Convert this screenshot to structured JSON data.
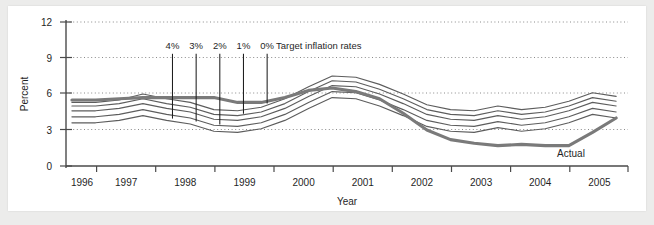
{
  "chart_data": {
    "type": "line",
    "title": "",
    "xlabel": "Year",
    "ylabel": "Percent",
    "ylim": [
      0,
      12
    ],
    "yticks": [
      0,
      3,
      6,
      9,
      12
    ],
    "ytick_labels": [
      "0",
      "3",
      "6",
      "9",
      "12"
    ],
    "xlim": [
      1995.5,
      2005.0
    ],
    "xtick_labels": [
      "1996",
      "1997",
      "1998",
      "1999",
      "2000",
      "2001",
      "2002",
      "2003",
      "2004",
      "2005"
    ],
    "grid": "horizontal dotted gridlines at 3, 6, 9, 12",
    "legend_position": "inline annotations",
    "annotations": {
      "target_group_label": "Target inflation rates",
      "actual_label": "Actual"
    },
    "target_markers": [
      {
        "label": "4%",
        "x": 1997.3,
        "y_top": 9.35,
        "y_bottom": 3.95
      },
      {
        "label": "3%",
        "x": 1997.7,
        "y_top": 9.35,
        "y_bottom": 3.7
      },
      {
        "label": "2%",
        "x": 1998.1,
        "y_top": 9.35,
        "y_bottom": 3.45
      },
      {
        "label": "1%",
        "x": 1998.5,
        "y_top": 9.35,
        "y_bottom": 4.35
      },
      {
        "label": "0%",
        "x": 1998.9,
        "y_top": 9.35,
        "y_bottom": 5.2
      }
    ],
    "x": [
      1995.6,
      1996.0,
      1996.4,
      1996.8,
      1997.2,
      1997.6,
      1998.0,
      1998.4,
      1998.8,
      1999.2,
      1999.6,
      2000.0,
      2000.4,
      2000.8,
      2001.2,
      2001.6,
      2002.0,
      2002.4,
      2002.8,
      2003.2,
      2003.6,
      2004.0,
      2004.4,
      2004.8
    ],
    "series": [
      {
        "name": "Target inflation 4%",
        "style": "thin",
        "values": [
          5.3,
          5.3,
          5.5,
          6.0,
          5.6,
          5.3,
          4.7,
          4.6,
          4.9,
          5.6,
          6.6,
          7.5,
          7.4,
          6.8,
          6.0,
          5.1,
          4.7,
          4.6,
          5.0,
          4.7,
          4.9,
          5.4,
          6.1,
          5.8
        ]
      },
      {
        "name": "Target inflation 3%",
        "style": "thin",
        "values": [
          5.0,
          5.0,
          5.2,
          5.6,
          5.2,
          4.9,
          4.3,
          4.2,
          4.5,
          5.2,
          6.2,
          7.1,
          7.0,
          6.4,
          5.6,
          4.7,
          4.3,
          4.2,
          4.6,
          4.3,
          4.5,
          5.0,
          5.7,
          5.4
        ]
      },
      {
        "name": "Target inflation 2%",
        "style": "thin",
        "values": [
          4.6,
          4.6,
          4.8,
          5.2,
          4.8,
          4.5,
          3.9,
          3.8,
          4.1,
          4.8,
          5.8,
          6.7,
          6.6,
          6.0,
          5.2,
          4.3,
          3.9,
          3.8,
          4.2,
          3.9,
          4.1,
          4.6,
          5.3,
          5.0
        ]
      },
      {
        "name": "Target inflation 1%",
        "style": "thin",
        "values": [
          4.1,
          4.1,
          4.3,
          4.7,
          4.3,
          4.0,
          3.4,
          3.3,
          3.6,
          4.3,
          5.3,
          6.2,
          6.1,
          5.5,
          4.7,
          3.8,
          3.4,
          3.3,
          3.7,
          3.4,
          3.6,
          4.1,
          4.8,
          4.5
        ]
      },
      {
        "name": "Target inflation 0%",
        "style": "thin",
        "values": [
          3.6,
          3.6,
          3.8,
          4.2,
          3.8,
          3.5,
          2.9,
          2.8,
          3.1,
          3.8,
          4.8,
          5.7,
          5.6,
          5.0,
          4.2,
          3.3,
          2.9,
          2.8,
          3.2,
          2.9,
          3.1,
          3.6,
          4.3,
          4.0
        ]
      },
      {
        "name": "Actual",
        "style": "thick",
        "values": [
          5.5,
          5.5,
          5.6,
          5.7,
          5.7,
          5.7,
          5.7,
          5.3,
          5.3,
          5.7,
          6.3,
          6.5,
          6.2,
          5.6,
          4.4,
          3.0,
          2.2,
          1.9,
          1.7,
          1.8,
          1.7,
          1.7,
          2.8,
          4.0
        ]
      }
    ]
  },
  "labels": {
    "y_axis_title": "Percent",
    "x_axis_title": "Year",
    "target_group": "Target inflation rates",
    "actual": "Actual",
    "target_4": "4%",
    "target_3": "3%",
    "target_2": "2%",
    "target_1": "1%",
    "target_0": "0%",
    "y0": "0",
    "y3": "3",
    "y6": "6",
    "y9": "9",
    "y12": "12",
    "x1996": "1996",
    "x1997": "1997",
    "x1998": "1998",
    "x1999": "1999",
    "x2000": "2000",
    "x2001": "2001",
    "x2002": "2002",
    "x2003": "2003",
    "x2004": "2004",
    "x2005": "2005"
  },
  "colors": {
    "background": "#ececeb",
    "card": "#ffffff",
    "axis": "#4a4a4a",
    "series": "#5d5d5d",
    "actual": "#7a7a7a",
    "grid": "#8a8a8a",
    "text": "#1f1f1f"
  }
}
